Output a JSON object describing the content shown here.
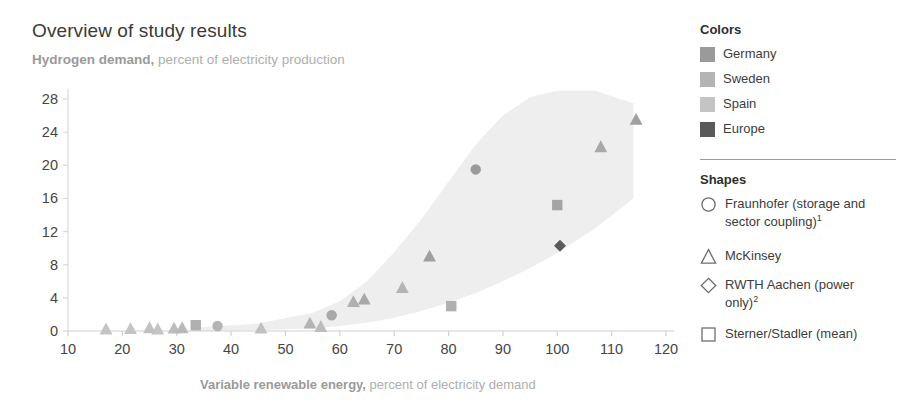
{
  "title": "Overview of study results",
  "subtitle": {
    "strong": "Hydrogen demand,",
    "light": " percent of electricity production"
  },
  "axis_title": {
    "strong": "Variable renewable energy,",
    "light": " percent of electricity demand"
  },
  "legend": {
    "colors_heading": "Colors",
    "shapes_heading": "Shapes",
    "colors": [
      {
        "label": "Germany",
        "color": "#9a9a9a"
      },
      {
        "label": "Sweden",
        "color": "#b4b4b4"
      },
      {
        "label": "Spain",
        "color": "#c4c4c4"
      },
      {
        "label": "Europe",
        "color": "#5a5a5a"
      }
    ],
    "shapes": [
      {
        "shape": "circle",
        "label": "Fraunhofer (storage and sector coupling)",
        "note": "1"
      },
      {
        "shape": "triangle",
        "label": "McKinsey",
        "note": ""
      },
      {
        "shape": "diamond",
        "label": "RWTH Aachen (power only)",
        "note": "2"
      },
      {
        "shape": "square",
        "label": "Sterner/Stadler (mean)",
        "note": ""
      }
    ]
  },
  "chart_data": {
    "type": "scatter",
    "title": "Overview of study results",
    "xlabel": "Variable renewable energy, percent of electricity demand",
    "ylabel": "Hydrogen demand, percent of electricity production",
    "xlim": [
      10,
      120
    ],
    "ylim": [
      0,
      29
    ],
    "xticks": [
      10,
      20,
      30,
      40,
      50,
      60,
      70,
      80,
      90,
      100,
      110,
      120
    ],
    "yticks": [
      0,
      4,
      8,
      12,
      16,
      20,
      24,
      28
    ],
    "grid": false,
    "legend_position": "right",
    "band": {
      "label": "range of study results",
      "fill": "#eeeeee",
      "upper": [
        [
          33,
          0.4
        ],
        [
          45,
          0.9
        ],
        [
          55,
          2.2
        ],
        [
          60,
          3.6
        ],
        [
          65,
          6.0
        ],
        [
          70,
          9.5
        ],
        [
          75,
          13.5
        ],
        [
          80,
          18.0
        ],
        [
          85,
          22.5
        ],
        [
          90,
          26.0
        ],
        [
          95,
          28.2
        ],
        [
          100,
          29.0
        ],
        [
          107,
          29.0
        ],
        [
          114,
          27.5
        ]
      ],
      "lower": [
        [
          33,
          0.0
        ],
        [
          45,
          0.1
        ],
        [
          55,
          0.3
        ],
        [
          60,
          0.6
        ],
        [
          65,
          1.0
        ],
        [
          70,
          1.6
        ],
        [
          75,
          2.4
        ],
        [
          80,
          3.4
        ],
        [
          85,
          4.6
        ],
        [
          90,
          6.0
        ],
        [
          95,
          7.6
        ],
        [
          100,
          9.4
        ],
        [
          107,
          12.4
        ],
        [
          114,
          16.0
        ]
      ]
    },
    "points": [
      {
        "x": 17.0,
        "y": 0.2,
        "shape": "triangle",
        "color": "#c4c4c4",
        "series": "Spain"
      },
      {
        "x": 21.5,
        "y": 0.25,
        "shape": "triangle",
        "color": "#c4c4c4",
        "series": "Spain"
      },
      {
        "x": 25.0,
        "y": 0.35,
        "shape": "triangle",
        "color": "#c0c0c0",
        "series": "Spain"
      },
      {
        "x": 26.5,
        "y": 0.2,
        "shape": "triangle",
        "color": "#c4c4c4",
        "series": "Spain"
      },
      {
        "x": 29.5,
        "y": 0.3,
        "shape": "triangle",
        "color": "#bcbcbc",
        "series": "Sweden"
      },
      {
        "x": 31.0,
        "y": 0.35,
        "shape": "triangle",
        "color": "#b8b8b8",
        "series": "Sweden"
      },
      {
        "x": 33.5,
        "y": 0.7,
        "shape": "square",
        "color": "#b0b0b0",
        "series": "Sweden"
      },
      {
        "x": 37.5,
        "y": 0.6,
        "shape": "circle",
        "color": "#b4b4b4",
        "series": "Sweden"
      },
      {
        "x": 45.5,
        "y": 0.3,
        "shape": "triangle",
        "color": "#c0c0c0",
        "series": "Spain"
      },
      {
        "x": 54.5,
        "y": 0.9,
        "shape": "triangle",
        "color": "#b4b4b4",
        "series": "Sweden"
      },
      {
        "x": 56.5,
        "y": 0.5,
        "shape": "triangle",
        "color": "#bcbcbc",
        "series": "Sweden"
      },
      {
        "x": 58.5,
        "y": 1.9,
        "shape": "circle",
        "color": "#a8a8a8",
        "series": "Germany"
      },
      {
        "x": 62.5,
        "y": 3.5,
        "shape": "triangle",
        "color": "#b0b0b0",
        "series": "Sweden"
      },
      {
        "x": 64.5,
        "y": 3.8,
        "shape": "triangle",
        "color": "#a8a8a8",
        "series": "Germany"
      },
      {
        "x": 71.5,
        "y": 5.2,
        "shape": "triangle",
        "color": "#b4b4b4",
        "series": "Sweden"
      },
      {
        "x": 76.5,
        "y": 9.0,
        "shape": "triangle",
        "color": "#a0a0a0",
        "series": "Germany"
      },
      {
        "x": 80.5,
        "y": 3.0,
        "shape": "square",
        "color": "#b0b0b0",
        "series": "Sweden"
      },
      {
        "x": 85.0,
        "y": 19.5,
        "shape": "circle",
        "color": "#9a9a9a",
        "series": "Germany"
      },
      {
        "x": 100.0,
        "y": 15.2,
        "shape": "square",
        "color": "#a4a4a4",
        "series": "Germany"
      },
      {
        "x": 100.5,
        "y": 10.3,
        "shape": "diamond",
        "color": "#5a5a5a",
        "series": "Europe"
      },
      {
        "x": 108.0,
        "y": 22.2,
        "shape": "triangle",
        "color": "#a8a8a8",
        "series": "Germany"
      },
      {
        "x": 114.5,
        "y": 25.5,
        "shape": "triangle",
        "color": "#a0a0a0",
        "series": "Germany"
      }
    ]
  }
}
